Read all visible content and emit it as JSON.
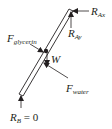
{
  "diagram": {
    "type": "free-body-diagram",
    "stroke_color": "#231f20",
    "background": "#ffffff"
  },
  "labels": {
    "r_ax": {
      "main": "R",
      "sub": "Ax"
    },
    "r_ay": {
      "main": "R",
      "sub": "Ay"
    },
    "f_glycerin": {
      "main": "F",
      "sub": "glycerin"
    },
    "weight": {
      "main": "W"
    },
    "f_water": {
      "main": "F",
      "sub": "water"
    },
    "r_b": {
      "main": "R",
      "sub": "B",
      "suffix": " = 0"
    }
  },
  "forces": [
    {
      "name": "R_Ax",
      "direction": "horizontal, pointing left into top end"
    },
    {
      "name": "R_Ay",
      "direction": "vertical, pointing up into top end"
    },
    {
      "name": "F_glycerin",
      "direction": "normal to rod, from upper-left side"
    },
    {
      "name": "W",
      "direction": "vertical, downward at rod center"
    },
    {
      "name": "F_water",
      "direction": "normal to rod, from lower-right side"
    },
    {
      "name": "R_B",
      "value": "0",
      "direction": "vertical, pointing up into bottom end"
    }
  ]
}
